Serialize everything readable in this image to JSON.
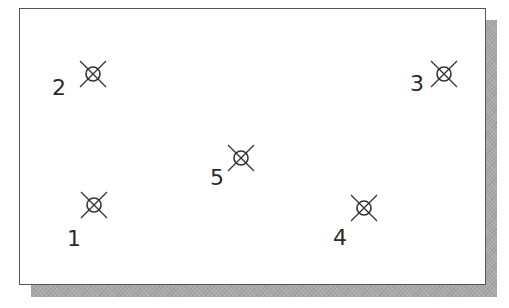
{
  "diagram": {
    "frame": {
      "x": 19,
      "y": 8,
      "width": 467,
      "height": 277,
      "border_color": "#555555",
      "fill": "#ffffff"
    },
    "shadow": {
      "offset_x": 12,
      "offset_y": 12,
      "color": "#a9a9a9"
    },
    "marker_style": {
      "circle_radius": 7,
      "x_arm": 13,
      "color": "#333333"
    },
    "points": [
      {
        "id": "1",
        "label": "1",
        "cx": 94,
        "cy": 205,
        "label_x": 67,
        "label_y": 246
      },
      {
        "id": "2",
        "label": "2",
        "cx": 93,
        "cy": 74,
        "label_x": 52,
        "label_y": 95
      },
      {
        "id": "3",
        "label": "3",
        "cx": 444,
        "cy": 74,
        "label_x": 410,
        "label_y": 91
      },
      {
        "id": "4",
        "label": "4",
        "cx": 364,
        "cy": 208,
        "label_x": 333,
        "label_y": 245
      },
      {
        "id": "5",
        "label": "5",
        "cx": 241,
        "cy": 158,
        "label_x": 210,
        "label_y": 185
      }
    ]
  }
}
